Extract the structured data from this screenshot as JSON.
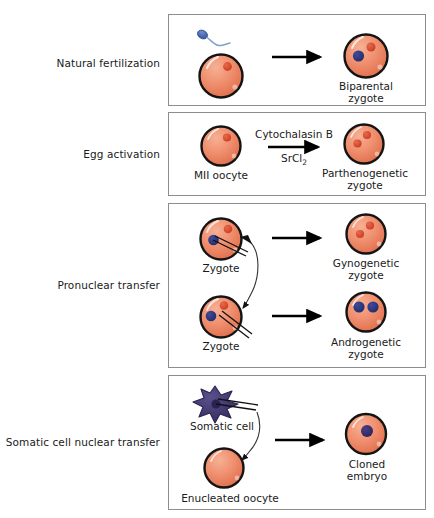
{
  "figure": {
    "rows": [
      {
        "id": "natural-fertilization",
        "label": "Natural fertilization",
        "inputs": [
          {
            "name": "sperm",
            "caption": ""
          },
          {
            "name": "oocyte",
            "caption": ""
          }
        ],
        "reagents": {
          "above": "",
          "below": ""
        },
        "outputs": [
          {
            "name": "biparental-zygote",
            "caption_line1": "Biparental",
            "caption_line2": "zygote"
          }
        ]
      },
      {
        "id": "egg-activation",
        "label": "Egg activation",
        "inputs": [
          {
            "name": "mii-oocyte",
            "caption_line1": "MII oocyte",
            "caption_line2": ""
          }
        ],
        "reagents": {
          "above": "Cytochalasin B",
          "below_text": "SrCl",
          "below_sub": "2"
        },
        "outputs": [
          {
            "name": "parthenogenetic-zygote",
            "caption_line1": "Parthenogenetic",
            "caption_line2": "zygote"
          }
        ]
      },
      {
        "id": "pronuclear-transfer",
        "label": "Pronuclear transfer",
        "inputs": [
          {
            "name": "donor-zygote",
            "caption_line1": "Zygote",
            "caption_line2": ""
          },
          {
            "name": "recipient-zygote",
            "caption_line1": "Zygote",
            "caption_line2": ""
          }
        ],
        "reagents": {
          "above": "",
          "below": ""
        },
        "outputs": [
          {
            "name": "gynogenetic-zygote",
            "caption_line1": "Gynogenetic",
            "caption_line2": "zygote"
          },
          {
            "name": "androgenetic-zygote",
            "caption_line1": "Androgenetic",
            "caption_line2": "zygote"
          }
        ]
      },
      {
        "id": "somatic-cell-nuclear-transfer",
        "label": "Somatic cell nuclear transfer",
        "inputs": [
          {
            "name": "somatic-cell",
            "caption_line1": "Somatic cell",
            "caption_line2": ""
          },
          {
            "name": "enucleated-oocyte",
            "caption_line1": "Enucleated oocyte",
            "caption_line2": ""
          }
        ],
        "reagents": {
          "above": "",
          "below": ""
        },
        "outputs": [
          {
            "name": "cloned-embryo",
            "caption_line1": "Cloned",
            "caption_line2": "embryo"
          }
        ]
      }
    ],
    "colors": {
      "cell_fill_light": "#f4a183",
      "cell_fill_dark": "#e4714e",
      "cell_outline": "#141414",
      "pronucleus_maternal": "#d8452a",
      "pronucleus_paternal": "#2b3a86",
      "somatic_cell": "#3d3668",
      "somatic_nucleus": "#2a2350",
      "cloned_nucleus": "#3b2f6e",
      "sperm_head": "#4a6fb0",
      "arrow": "#000000",
      "panel_border": "#8d8d8d",
      "background": "#ffffff",
      "text": "#1a1a1a"
    }
  }
}
